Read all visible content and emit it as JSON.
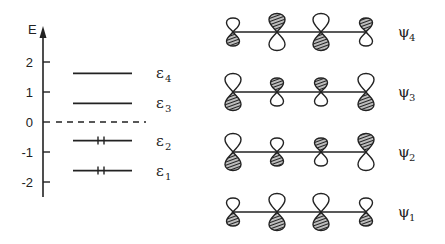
{
  "diagram": {
    "colors": {
      "ink": "#222222",
      "background": "#ffffff"
    },
    "energy_axis": {
      "label": "E",
      "ticks": [
        2,
        1,
        0,
        -1,
        -2
      ],
      "zero_line": "dashed"
    },
    "levels": [
      {
        "symbol": "ε",
        "subscript": "4",
        "energy": 1.62,
        "electrons": 0
      },
      {
        "symbol": "ε",
        "subscript": "3",
        "energy": 0.62,
        "electrons": 0
      },
      {
        "symbol": "ε",
        "subscript": "2",
        "energy": -0.62,
        "electrons": 2
      },
      {
        "symbol": "ε",
        "subscript": "1",
        "energy": -1.62,
        "electrons": 2
      }
    ],
    "orbitals": [
      {
        "symbol": "ψ",
        "subscript": "4",
        "coefficients": [
          0.37,
          -0.6,
          0.6,
          -0.37
        ]
      },
      {
        "symbol": "ψ",
        "subscript": "3",
        "coefficients": [
          0.6,
          -0.37,
          -0.37,
          0.6
        ]
      },
      {
        "symbol": "ψ",
        "subscript": "2",
        "coefficients": [
          0.6,
          0.37,
          -0.37,
          -0.6
        ]
      },
      {
        "symbol": "ψ",
        "subscript": "1",
        "coefficients": [
          0.37,
          0.6,
          0.6,
          0.37
        ]
      }
    ],
    "legend": {
      "hatched": "positive lobe down (hatched)",
      "open": "open lobe"
    }
  }
}
